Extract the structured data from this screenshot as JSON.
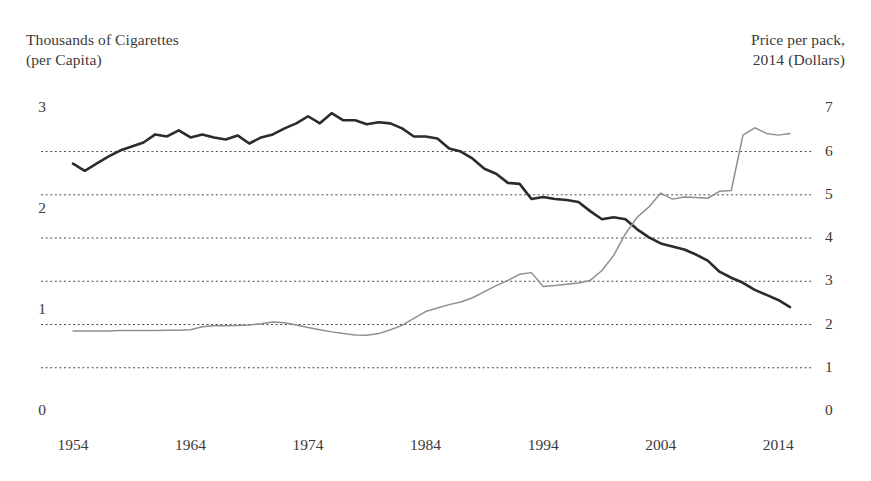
{
  "chart_data": {
    "type": "line",
    "title": "",
    "xlabel": "",
    "ylabel": "Thousands of Cigarettes (per Capita)",
    "y2label": "Price per pack, 2014 (Dollars)",
    "grid": true,
    "legend_position": "none",
    "xlim": [
      1954,
      2015
    ],
    "ylim": [
      0,
      3.2
    ],
    "y2lim": [
      0,
      7.47
    ],
    "xticks": [
      1954,
      1964,
      1974,
      1984,
      1994,
      2004,
      2014
    ],
    "yticks_left": [
      0,
      1,
      2,
      3
    ],
    "yticks_right": [
      0,
      1,
      2,
      3,
      4,
      5,
      6,
      7
    ],
    "gridline_values_right": [
      1,
      2,
      3,
      4,
      5,
      6
    ],
    "x": [
      1954,
      1955,
      1956,
      1957,
      1958,
      1959,
      1960,
      1961,
      1962,
      1963,
      1964,
      1965,
      1966,
      1967,
      1968,
      1969,
      1970,
      1971,
      1972,
      1973,
      1974,
      1975,
      1976,
      1977,
      1978,
      1979,
      1980,
      1981,
      1982,
      1983,
      1984,
      1985,
      1986,
      1987,
      1988,
      1989,
      1990,
      1991,
      1992,
      1993,
      1994,
      1995,
      1996,
      1997,
      1998,
      1999,
      2000,
      2001,
      2002,
      2003,
      2004,
      2005,
      2006,
      2007,
      2008,
      2009,
      2010,
      2011,
      2012,
      2013,
      2014,
      2015
    ],
    "series": [
      {
        "name": "Thousands of Cigarettes (per Capita)",
        "axis": "left",
        "color": "#2b2b2b",
        "width": 2.6,
        "values": [
          2.45,
          2.38,
          2.45,
          2.52,
          2.58,
          2.62,
          2.66,
          2.74,
          2.72,
          2.78,
          2.71,
          2.74,
          2.71,
          2.69,
          2.73,
          2.65,
          2.71,
          2.74,
          2.8,
          2.85,
          2.92,
          2.85,
          2.95,
          2.88,
          2.88,
          2.84,
          2.86,
          2.85,
          2.8,
          2.72,
          2.72,
          2.7,
          2.6,
          2.57,
          2.5,
          2.4,
          2.35,
          2.26,
          2.25,
          2.1,
          2.12,
          2.1,
          2.09,
          2.07,
          1.98,
          1.9,
          1.92,
          1.9,
          1.8,
          1.72,
          1.66,
          1.63,
          1.6,
          1.55,
          1.49,
          1.38,
          1.32,
          1.27,
          1.2,
          1.15,
          1.1,
          1.03
        ]
      },
      {
        "name": "Price per pack, 2014 (Dollars)",
        "axis": "right",
        "color": "#8f8f8f",
        "width": 1.5,
        "values": [
          1.85,
          1.85,
          1.85,
          1.85,
          1.86,
          1.86,
          1.86,
          1.86,
          1.87,
          1.87,
          1.88,
          1.95,
          1.97,
          1.97,
          1.98,
          1.99,
          2.02,
          2.06,
          2.04,
          1.99,
          1.93,
          1.88,
          1.83,
          1.79,
          1.76,
          1.75,
          1.79,
          1.88,
          1.98,
          2.14,
          2.3,
          2.38,
          2.46,
          2.52,
          2.62,
          2.76,
          2.9,
          3.02,
          3.16,
          3.2,
          2.88,
          2.9,
          2.93,
          2.96,
          3.02,
          3.25,
          3.6,
          4.1,
          4.48,
          4.72,
          5.04,
          4.9,
          4.95,
          4.94,
          4.92,
          5.08,
          5.1,
          6.38,
          6.55,
          6.42,
          6.38,
          6.42
        ]
      }
    ]
  },
  "axes": {
    "left_title": "Thousands of Cigarettes\n(per Capita)",
    "right_title": "Price per pack,\n2014 (Dollars)"
  }
}
